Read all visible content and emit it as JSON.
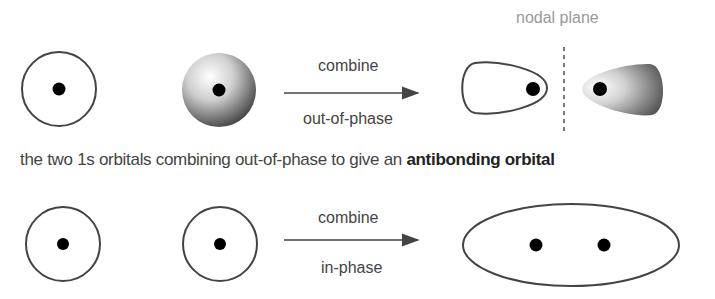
{
  "diagram": {
    "top_row": {
      "arrow_top_label": "combine",
      "arrow_bottom_label": "out-of-phase",
      "nodal_plane_label": "nodal plane"
    },
    "caption": {
      "prefix": "the two 1s orbitals combining out-of-phase to give an ",
      "bold": "antibonding orbital"
    },
    "bottom_row": {
      "arrow_top_label": "combine",
      "arrow_bottom_label": "in-phase"
    },
    "colors": {
      "outline": "#444444",
      "nucleus": "#000000",
      "shade_dark": "#555555",
      "nodal_plane": "#777777"
    }
  }
}
